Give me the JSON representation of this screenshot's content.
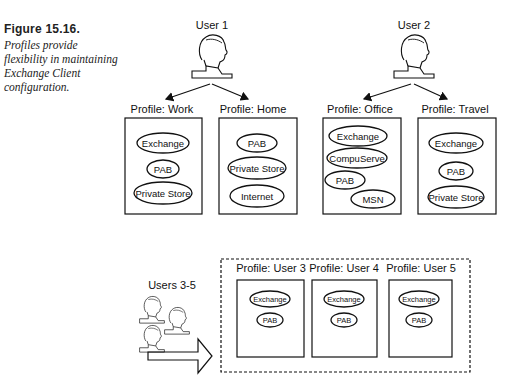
{
  "figure": {
    "label": "Figure 15.16.",
    "caption": "Profiles provide flexibility in maintaining Exchange Client configuration."
  },
  "users": [
    {
      "label": "User 1",
      "profiles": [
        {
          "title": "Profile: Work",
          "services": [
            "Exchange",
            "PAB",
            "Private Store"
          ]
        },
        {
          "title": "Profile: Home",
          "services": [
            "PAB",
            "Private Store",
            "Internet"
          ]
        }
      ]
    },
    {
      "label": "User 2",
      "profiles": [
        {
          "title": "Profile: Office",
          "services": [
            "Exchange",
            "CompuServe",
            "PAB",
            "MSN"
          ]
        },
        {
          "title": "Profile: Travel",
          "services": [
            "Exchange",
            "PAB",
            "Private Store"
          ]
        }
      ]
    }
  ],
  "shared_group": {
    "label": "Users 3-5",
    "profiles": [
      {
        "title": "Profile: User 3",
        "services": [
          "Exchange",
          "PAB"
        ]
      },
      {
        "title": "Profile: User 4",
        "services": [
          "Exchange",
          "PAB"
        ]
      },
      {
        "title": "Profile: User 5",
        "services": [
          "Exchange",
          "PAB"
        ]
      }
    ]
  },
  "colors": {
    "line": "#1a1a1a",
    "background": "#ffffff"
  }
}
